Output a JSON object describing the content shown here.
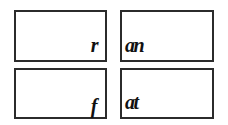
{
  "grid": {
    "cells": [
      {
        "text": "r",
        "align": "right",
        "position": "top-left"
      },
      {
        "text": "an",
        "align": "left",
        "position": "top-right"
      },
      {
        "text": "f",
        "align": "right",
        "position": "bottom-left"
      },
      {
        "text": "at",
        "align": "left",
        "position": "bottom-right"
      }
    ]
  },
  "colors": {
    "border": "#2b2b2b",
    "text": "#111111",
    "background": "#ffffff"
  }
}
